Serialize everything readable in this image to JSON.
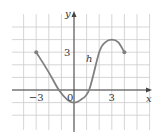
{
  "chart_data": {
    "type": "line",
    "title": "",
    "xlabel": "x",
    "ylabel": "y",
    "curve_label": "h",
    "xlim": [
      -4,
      6
    ],
    "ylim": [
      -3,
      5
    ],
    "grid": true,
    "tick_labels": {
      "x": [
        {
          "value": -3,
          "label": "−3"
        },
        {
          "value": 0,
          "label": "0"
        },
        {
          "value": 3,
          "label": "3"
        }
      ],
      "y": [
        {
          "value": 3,
          "label": "3"
        }
      ]
    },
    "series": [
      {
        "name": "h",
        "x": [
          -3,
          -2,
          -1.2,
          -0.5,
          0,
          0.5,
          1.2,
          2,
          2.5,
          3,
          3.5,
          4
        ],
        "y": [
          3,
          1.4,
          0,
          -0.8,
          -1,
          -0.8,
          0,
          3,
          3.8,
          4,
          3.8,
          3
        ],
        "endpoints": [
          {
            "x": -3,
            "y": 3,
            "closed": true
          },
          {
            "x": 4,
            "y": 3,
            "closed": true
          }
        ]
      }
    ]
  },
  "colors": {
    "curve": "#808080",
    "grid": "#cccccc",
    "axis": "#444444",
    "text": "#333333"
  }
}
